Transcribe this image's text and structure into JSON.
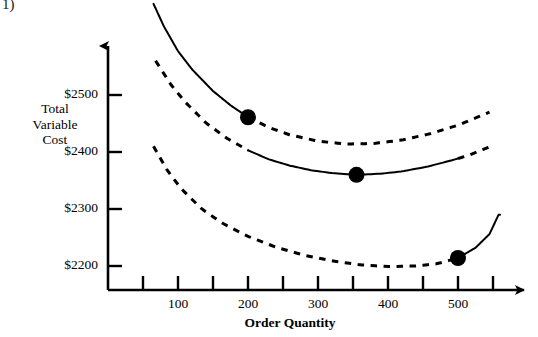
{
  "figure": {
    "corner_label": "1)",
    "background_color": "#ffffff",
    "ink_color": "#000000"
  },
  "chart_data": {
    "type": "line",
    "title": "",
    "subtitle": "",
    "xlabel": "Order Quantity",
    "ylabel": "Total Variable Cost",
    "ylabel_lines": [
      "Total",
      "Variable",
      "Cost"
    ],
    "xlim": [
      0,
      570
    ],
    "ylim": [
      2130,
      2580
    ],
    "grid": false,
    "legend": null,
    "x_ticks": [
      50,
      100,
      150,
      200,
      250,
      300,
      350,
      400,
      450,
      500,
      550
    ],
    "x_tick_labels": [
      "",
      "100",
      "",
      "200",
      "",
      "300",
      "",
      "400",
      "",
      "500",
      ""
    ],
    "y_ticks": [
      2200,
      2300,
      2400,
      2500
    ],
    "y_tick_labels": [
      "$2200",
      "$2300",
      "$2400",
      "$2500"
    ],
    "series": [
      {
        "name": "cost-curve-price-1",
        "style": "u-shaped cost curve (highest unit price)",
        "solid_range": [
          65,
          200
        ],
        "dashed_range": [
          200,
          545
        ],
        "x": [
          65,
          80,
          100,
          120,
          150,
          175,
          200,
          230,
          260,
          300,
          340,
          380,
          420,
          460,
          500,
          545
        ],
        "y": [
          2660,
          2620,
          2577,
          2545,
          2507,
          2482,
          2461,
          2443,
          2430,
          2419,
          2414,
          2415,
          2421,
          2432,
          2447,
          2470
        ]
      },
      {
        "name": "cost-curve-price-2",
        "style": "u-shaped cost curve (middle unit price)",
        "solid_range": [
          200,
          500
        ],
        "dashed_range_left": [
          68,
          200
        ],
        "dashed_range_right": [
          500,
          545
        ],
        "x": [
          68,
          90,
          110,
          140,
          170,
          200,
          230,
          260,
          290,
          320,
          355,
          390,
          420,
          455,
          490,
          515,
          545
        ],
        "y": [
          2560,
          2518,
          2488,
          2451,
          2424,
          2403,
          2387,
          2376,
          2368,
          2363,
          2360,
          2362,
          2366,
          2374,
          2385,
          2394,
          2409
        ]
      },
      {
        "name": "cost-curve-price-3",
        "style": "u-shaped cost curve (lowest unit price)",
        "solid_range": [
          500,
          560
        ],
        "dashed_range": [
          65,
          500
        ],
        "x": [
          65,
          85,
          105,
          135,
          165,
          200,
          240,
          280,
          320,
          360,
          400,
          440,
          470,
          500,
          525,
          545,
          558
        ],
        "y": [
          2410,
          2367,
          2335,
          2299,
          2274,
          2252,
          2233,
          2219,
          2209,
          2202,
          2199,
          2200,
          2204,
          2214,
          2232,
          2256,
          2290
        ]
      }
    ],
    "annotations": [
      {
        "name": "break-point-200",
        "marker": "filled-circle",
        "x": 200,
        "y": 2461,
        "description": "price break at order quantity 200"
      },
      {
        "name": "minimum-point-355",
        "marker": "filled-circle",
        "x": 355,
        "y": 2360,
        "description": "minimum total variable cost on middle curve"
      },
      {
        "name": "break-point-500",
        "marker": "filled-circle",
        "x": 500,
        "y": 2214,
        "description": "price break at order quantity 500"
      }
    ]
  }
}
